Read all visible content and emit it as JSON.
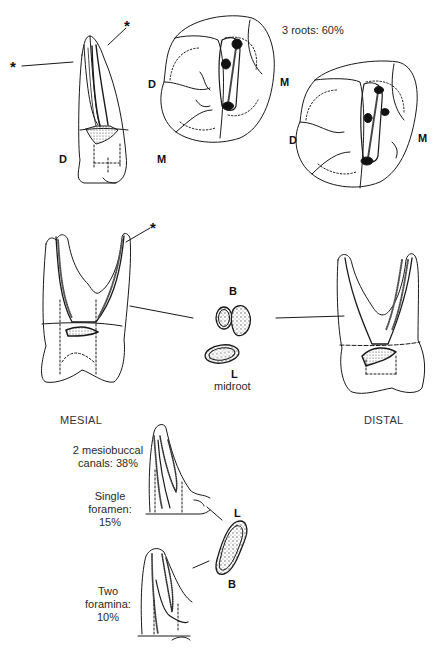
{
  "figure": {
    "markers": {
      "star": "*"
    },
    "buccal_view": {
      "labels": {
        "distal": "D",
        "mesial": "M"
      }
    },
    "occlusal_view_1": {
      "caption": "3 roots: 60%",
      "labels": {
        "distal": "D",
        "mesial": "M"
      }
    },
    "occlusal_view_2": {
      "labels": {
        "distal": "D",
        "mesial": "M"
      }
    },
    "cross_section_midroot": {
      "labels": {
        "buccal": "B",
        "lingual": "L",
        "level": "midroot"
      }
    },
    "mesial_view": {
      "caption": "MESIAL"
    },
    "distal_view": {
      "caption": "DISTAL"
    },
    "mesiobuccal_variants": {
      "header": "2 mesiobuccal canals: 38%",
      "header_line1": "2 mesiobuccal",
      "header_line2": "canals: 38%",
      "single_foramen": {
        "line1": "Single",
        "line2": "foramen:",
        "line3": "15%"
      },
      "two_foramina": {
        "line1": "Two",
        "line2": "foramina:",
        "line3": "10%"
      },
      "cross_section_labels": {
        "lingual": "L",
        "buccal": "B"
      }
    }
  }
}
